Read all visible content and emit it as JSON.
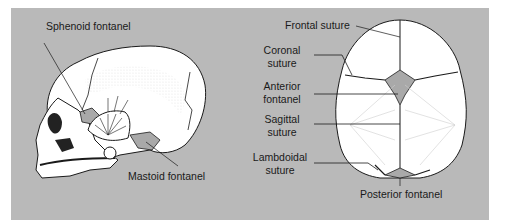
{
  "colors": {
    "panel": "#b9b9b9",
    "bone": "#ffffff",
    "line": "#1a1a1a",
    "fontanel": "#a9a9a9"
  },
  "lateral_view": {
    "labels": {
      "sphenoid": "Sphenoid fontanel",
      "mastoid": "Mastoid fontanel"
    }
  },
  "superior_view": {
    "labels": {
      "frontal": "Frontal suture",
      "coronal_1": "Coronal",
      "coronal_2": "suture",
      "anterior_1": "Anterior",
      "anterior_2": "fontanel",
      "sagittal_1": "Sagittal",
      "sagittal_2": "suture",
      "lambdoidal_1": "Lambdoidal",
      "lambdoidal_2": "suture",
      "posterior": "Posterior fontanel"
    }
  }
}
